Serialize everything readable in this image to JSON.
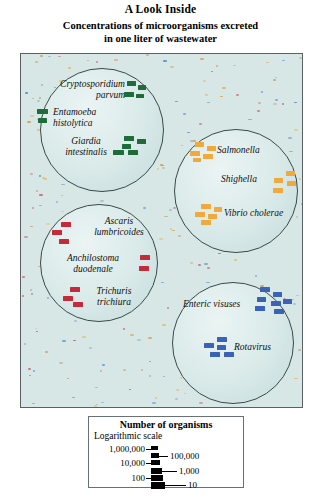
{
  "title": {
    "main": "A Look Inside",
    "subtitle_line1": "Concentrations of microorganisms excreted",
    "subtitle_line2": "in one liter of wastewater"
  },
  "colors": {
    "panel_background": "#d6e7e6",
    "panel_border": "#5a6166",
    "circle_fill": "#dceceb",
    "circle_border": "#3a4a4a",
    "protozoa_marker": "#1f6b3a",
    "bacteria_marker": "#f0a93c",
    "helminth_marker": "#c32b3a",
    "virus_marker": "#3a63b8",
    "legend_marker": "#000000"
  },
  "groups": [
    {
      "id": "protozoa",
      "name": "protozoa-circle",
      "marker_color": "#1f6b3a",
      "organisms": [
        {
          "name": "Cryptosporidium parvum",
          "line1": "Cryptosporidium",
          "line2": "parvum"
        },
        {
          "name": "Entamoeba histolytica",
          "line1": "Entamoeba",
          "line2": "histolytica"
        },
        {
          "name": "Giardia intestinalis",
          "line1": "Giardia",
          "line2": "intestinalis"
        }
      ]
    },
    {
      "id": "bacteria",
      "name": "bacteria-circle",
      "marker_color": "#f0a93c",
      "organisms": [
        {
          "name": "Salmonella",
          "line1": "Salmonella",
          "line2": ""
        },
        {
          "name": "Shighella",
          "line1": "Shighella",
          "line2": ""
        },
        {
          "name": "Vibrio cholerae",
          "line1": "Vibrio cholerae",
          "line2": ""
        }
      ]
    },
    {
      "id": "helminths",
      "name": "helminths-circle",
      "marker_color": "#c32b3a",
      "organisms": [
        {
          "name": "Ascaris lumbricoides",
          "line1": "Ascaris",
          "line2": "lumbricoides"
        },
        {
          "name": "Anchilostoma duodenale",
          "line1": "Anchilostoma",
          "line2": "duodenale"
        },
        {
          "name": "Trichuris trichiura",
          "line1": "Trichuris",
          "line2": "trichiura"
        }
      ]
    },
    {
      "id": "viruses",
      "name": "viruses-circle",
      "marker_color": "#3a63b8",
      "organisms": [
        {
          "name": "Enteric visuses",
          "line1": "Enteric visuses",
          "line2": ""
        },
        {
          "name": "Rotavirus",
          "line1": "Rotavirus",
          "line2": ""
        }
      ]
    }
  ],
  "labels": {
    "cryptosporidium_l1": "Cryptosporidium",
    "cryptosporidium_l2": "parvum",
    "entamoeba_l1": "Entamoeba",
    "entamoeba_l2": "histolytica",
    "giardia_l1": "Giardia",
    "giardia_l2": "intestinalis",
    "salmonella": "Salmonella",
    "shighella": "Shighella",
    "vibrio": "Vibrio cholerae",
    "ascaris_l1": "Ascaris",
    "ascaris_l2": "lumbricoides",
    "anchilostoma_l1": "Anchilostoma",
    "anchilostoma_l2": "duodenale",
    "trichuris_l1": "Trichuris",
    "trichuris_l2": "trichiura",
    "enteric": "Enteric visuses",
    "rotavirus": "Rotavirus"
  },
  "legend": {
    "title": "Number of organisms",
    "subtitle": "Logarithmic scale",
    "entries": [
      {
        "value": "1,000,000",
        "side": "left",
        "bar_width": 7,
        "bar_height": 4
      },
      {
        "value": "100,000",
        "side": "right",
        "bar_width": 8,
        "bar_height": 5
      },
      {
        "value": "10,000",
        "side": "left",
        "bar_width": 9,
        "bar_height": 5
      },
      {
        "value": "1,000",
        "side": "right",
        "bar_width": 11,
        "bar_height": 6
      },
      {
        "value": "100",
        "side": "left",
        "bar_width": 12,
        "bar_height": 6
      },
      {
        "value": "10",
        "side": "right",
        "bar_width": 14,
        "bar_height": 7
      }
    ]
  },
  "chart_data": {
    "type": "diagram",
    "title": "Concentrations of microorganisms excreted in one liter of wastewater",
    "scale": "logarithmic",
    "units": "organisms per liter of wastewater",
    "legend_values": [
      1000000,
      100000,
      10000,
      1000,
      100,
      10
    ],
    "groups": [
      {
        "group": "protozoa",
        "color": "#1f6b3a",
        "items": [
          {
            "organism": "Cryptosporidium parvum",
            "marker_count": 4
          },
          {
            "organism": "Entamoeba histolytica",
            "marker_count": 2
          },
          {
            "organism": "Giardia intestinalis",
            "marker_count": 5
          }
        ]
      },
      {
        "group": "bacteria",
        "color": "#f0a93c",
        "items": [
          {
            "organism": "Salmonella",
            "marker_count": 5
          },
          {
            "organism": "Shighella",
            "marker_count": 4
          },
          {
            "organism": "Vibrio cholerae",
            "marker_count": 5
          }
        ]
      },
      {
        "group": "helminths",
        "color": "#c32b3a",
        "items": [
          {
            "organism": "Ascaris lumbricoides",
            "marker_count": 3
          },
          {
            "organism": "Anchilostoma duodenale",
            "marker_count": 2
          },
          {
            "organism": "Trichuris trichiura",
            "marker_count": 3
          }
        ]
      },
      {
        "group": "viruses",
        "color": "#3a63b8",
        "items": [
          {
            "organism": "Enteric visuses",
            "marker_count": 7
          },
          {
            "organism": "Rotavirus",
            "marker_count": 5
          }
        ]
      }
    ]
  }
}
